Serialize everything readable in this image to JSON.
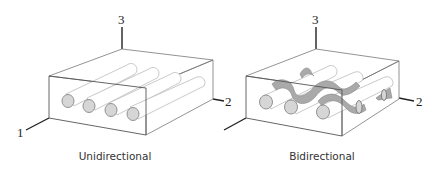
{
  "panels": [
    {
      "id": "unidirectional",
      "caption": "Unidirectional",
      "axes": {
        "axis1": "1",
        "axis2": "2",
        "axis3": "3"
      },
      "fiber_count": 4
    },
    {
      "id": "bidirectional",
      "caption": "Bidirectional",
      "axes": {
        "axis1": "1",
        "axis2": "2",
        "axis3": "3"
      },
      "fiber_count": 3,
      "weft_count": 2
    }
  ],
  "colors": {
    "outline": "#555555",
    "axis": "#222222",
    "fiber_end": "#d6d6d6",
    "fiber_body": "#ffffff",
    "weft": "#a9a9a9"
  }
}
